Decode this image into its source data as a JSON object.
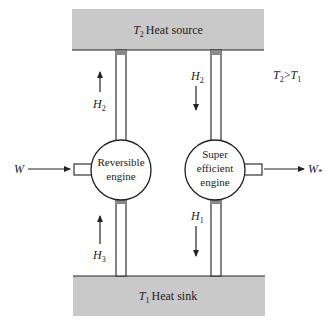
{
  "diagram": {
    "type": "thermodynamics-engine-schematic",
    "heat_source": {
      "symbol": "T",
      "subscript": "2",
      "label": "Heat source",
      "fill": "#c9c9c9"
    },
    "heat_sink": {
      "symbol": "T",
      "subscript": "1",
      "label": "Heat sink",
      "fill": "#c9c9c9"
    },
    "condition": {
      "left_symbol": "T",
      "left_sub": "2",
      "op": ">",
      "right_symbol": "T",
      "right_sub": "1"
    },
    "engines": [
      {
        "id": "reversible",
        "line1": "Reversible",
        "line2": "engine",
        "line3": ""
      },
      {
        "id": "super",
        "line1": "Super",
        "line2": "efficient",
        "line3": "engine"
      }
    ],
    "flows": [
      {
        "id": "left-top",
        "symbol": "H",
        "sub": "2",
        "direction": "up"
      },
      {
        "id": "left-bottom",
        "symbol": "H",
        "sub": "3",
        "direction": "up"
      },
      {
        "id": "right-top",
        "symbol": "H",
        "sub": "2",
        "direction": "down"
      },
      {
        "id": "right-bottom",
        "symbol": "H",
        "sub": "1",
        "direction": "down"
      }
    ],
    "work_in": {
      "symbol": "W",
      "sub": ""
    },
    "work_out": {
      "symbol": "W",
      "sub": "*"
    }
  }
}
